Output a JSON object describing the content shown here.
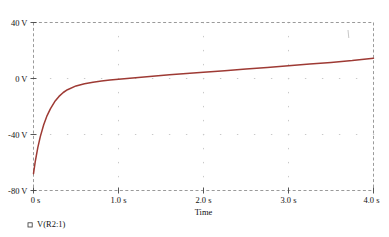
{
  "chart_data": {
    "type": "line",
    "title": "",
    "xlabel": "Time",
    "ylabel": "",
    "xlim": [
      0,
      4.0
    ],
    "ylim": [
      -80,
      40
    ],
    "grid": true,
    "grid_style": "dotted",
    "legend_position": "bottom-left",
    "series": [
      {
        "name": "V(R2:1)",
        "color": "#9E3A34",
        "marker": "square-outline",
        "x": [
          0.0,
          0.02,
          0.05,
          0.08,
          0.12,
          0.16,
          0.2,
          0.25,
          0.3,
          0.35,
          0.4,
          0.5,
          0.6,
          0.7,
          0.8,
          0.9,
          1.0,
          1.2,
          1.4,
          1.6,
          1.8,
          2.0,
          2.25,
          2.5,
          2.75,
          3.0,
          3.25,
          3.5,
          3.75,
          4.0
        ],
        "y": [
          -68.0,
          -59.5,
          -49.5,
          -41.5,
          -33.0,
          -26.5,
          -21.5,
          -16.5,
          -12.8,
          -10.0,
          -8.0,
          -5.3,
          -3.7,
          -2.6,
          -1.8,
          -1.1,
          -0.5,
          0.6,
          1.6,
          2.6,
          3.5,
          4.4,
          5.6,
          6.8,
          7.9,
          9.1,
          10.3,
          11.5,
          12.8,
          14.5
        ]
      }
    ],
    "y_ticks": [
      {
        "value": 40,
        "label": "40 V"
      },
      {
        "value": 0,
        "label": "0 V"
      },
      {
        "value": -40,
        "label": "-40 V"
      },
      {
        "value": -80,
        "label": "-80 V"
      }
    ],
    "x_ticks": [
      {
        "value": 0.0,
        "label": "0 s"
      },
      {
        "value": 1.0,
        "label": "1.0 s"
      },
      {
        "value": 2.0,
        "label": "2.0 s"
      },
      {
        "value": 3.0,
        "label": "3.0 s"
      },
      {
        "value": 4.0,
        "label": "4.0 s"
      }
    ],
    "y_minor_count": 4,
    "x_minor_count": 5,
    "frame_color": "#9a9a9a",
    "grid_color": "#c9c9c9"
  },
  "legend": {
    "entries": [
      {
        "label": "V(R2:1)",
        "color": "#9E3A34"
      }
    ]
  },
  "axis": {
    "x_title": "Time"
  }
}
